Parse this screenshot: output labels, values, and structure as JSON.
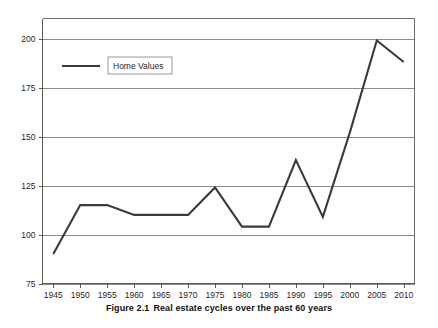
{
  "figure": {
    "caption_number": "Figure 2.1",
    "caption_text": "Real estate cycles over the past 60 years"
  },
  "legend": {
    "entries": [
      {
        "label": "Home Values",
        "color": "#3a3a3a"
      }
    ],
    "position": "inside-top-left"
  },
  "colors": {
    "line": "#3a3a3a",
    "gridline": "#8c8c8c",
    "frame": "#6e6e6e",
    "text": "#1f1f1f",
    "background": "#ffffff"
  },
  "chart_data": {
    "type": "line",
    "title": "",
    "xlabel": "",
    "ylabel": "",
    "x": [
      1945,
      1950,
      1955,
      1960,
      1965,
      1970,
      1975,
      1980,
      1985,
      1990,
      1995,
      2000,
      2005,
      2010
    ],
    "categories": [
      "1945",
      "1950",
      "1955",
      "1960",
      "1965",
      "1970",
      "1975",
      "1980",
      "1985",
      "1990",
      "1995",
      "2000",
      "2005",
      "2010"
    ],
    "series": [
      {
        "name": "Home Values",
        "values": [
          90,
          115,
          115,
          110,
          110,
          110,
          124,
          104,
          104,
          138,
          109,
          152,
          199,
          188
        ]
      }
    ],
    "xlim": [
      1943,
      2012
    ],
    "ylim": [
      75,
      200
    ],
    "yticks": [
      75,
      100,
      125,
      150,
      175,
      200
    ],
    "ytick_labels": [
      "75",
      "100",
      "125",
      "150",
      "175",
      "200"
    ],
    "xticks": [
      1945,
      1950,
      1955,
      1960,
      1965,
      1970,
      1975,
      1980,
      1985,
      1990,
      1995,
      2000,
      2005,
      2010
    ],
    "xtick_labels": [
      "1945",
      "1950",
      "1955",
      "1960",
      "1965",
      "1970",
      "1975",
      "1980",
      "1985",
      "1990",
      "1995",
      "2000",
      "2005",
      "2010"
    ],
    "grid": "horizontal",
    "legend": [
      "Home Values"
    ],
    "legend_position": "inside-top-left"
  }
}
